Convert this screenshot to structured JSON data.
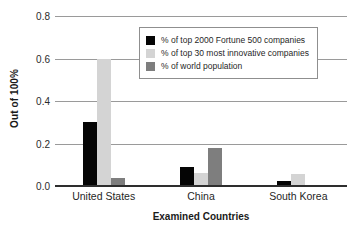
{
  "chart_data": {
    "type": "bar",
    "title": "",
    "subtitle": "",
    "xlabel": "Examined Countries",
    "ylabel": "Out of 100%",
    "categories": [
      "United States",
      "China",
      "South Korea"
    ],
    "series": [
      {
        "name": "% of top 2000 Fortune 500 companies",
        "color": "#050505",
        "values": [
          0.3,
          0.09,
          0.025
        ]
      },
      {
        "name": "% of top 30 most innovative companies",
        "color": "#d4d4d4",
        "values": [
          0.6,
          0.06,
          0.055
        ]
      },
      {
        "name": "% of world population",
        "color": "#7e7e7e",
        "values": [
          0.04,
          0.18,
          0.005
        ]
      }
    ],
    "ylim": [
      0.0,
      0.8
    ],
    "yticks": [
      0.0,
      0.2,
      0.4,
      0.6,
      0.8
    ],
    "ytick_labels": [
      "0.0",
      "0.2",
      "0.4",
      "0.6",
      "0.8"
    ],
    "grid": true,
    "grid_axis": "y",
    "legend_position": "upper center",
    "annotations": []
  }
}
